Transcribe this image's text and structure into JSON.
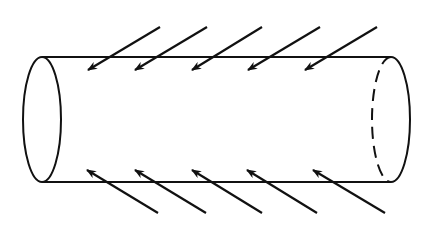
{
  "diagram": {
    "stroke_color": "#111111",
    "background": "#ffffff",
    "cylinder": {
      "top_y": 57,
      "bottom_y": 182,
      "left_x": 42,
      "right_x": 391,
      "end_rx": 19
    },
    "top_arrows": [
      {
        "tail": [
          160,
          27
        ],
        "tip": [
          88,
          70
        ]
      },
      {
        "tail": [
          207,
          27
        ],
        "tip": [
          135,
          70
        ]
      },
      {
        "tail": [
          262,
          27
        ],
        "tip": [
          192,
          70
        ]
      },
      {
        "tail": [
          320,
          27
        ],
        "tip": [
          248,
          70
        ]
      },
      {
        "tail": [
          377,
          27
        ],
        "tip": [
          305,
          70
        ]
      }
    ],
    "bottom_arrows": [
      {
        "tail": [
          158,
          213
        ],
        "tip": [
          87,
          170
        ]
      },
      {
        "tail": [
          206,
          213
        ],
        "tip": [
          135,
          170
        ]
      },
      {
        "tail": [
          262,
          213
        ],
        "tip": [
          192,
          170
        ]
      },
      {
        "tail": [
          317,
          213
        ],
        "tip": [
          247,
          170
        ]
      },
      {
        "tail": [
          385,
          213
        ],
        "tip": [
          313,
          170
        ]
      }
    ]
  }
}
